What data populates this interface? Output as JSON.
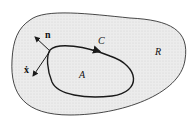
{
  "diagram": {
    "labels": {
      "region_outer": "R",
      "region_inner": "A",
      "curve": "C",
      "normal": "n",
      "velocity": "ẋ"
    },
    "colors": {
      "background": "#ffffff",
      "region_fill": "#e8e8e8",
      "stroke": "#1a1a1a"
    }
  }
}
